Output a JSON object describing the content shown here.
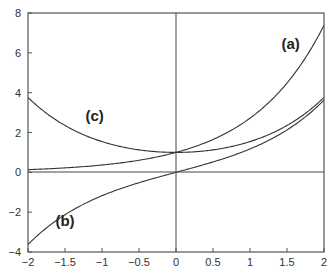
{
  "chart_data": {
    "type": "line",
    "title": "",
    "xlabel": "",
    "ylabel": "",
    "xlim": [
      -2,
      2
    ],
    "ylim": [
      -4,
      8
    ],
    "grid": false,
    "x_ticks": [
      -2,
      -1.5,
      -1,
      -0.5,
      0,
      0.5,
      1,
      1.5,
      2
    ],
    "x_tick_labels": [
      "−2",
      "−1.5",
      "−1",
      "−0.5",
      "0",
      "0.5",
      "1",
      "1.5",
      "2"
    ],
    "y_ticks": [
      -4,
      -2,
      0,
      2,
      4,
      6,
      8
    ],
    "y_tick_labels": [
      "−4",
      "−2",
      "0",
      "2",
      "4",
      "6",
      "8"
    ],
    "x": [
      -2,
      -1.5,
      -1,
      -0.5,
      0,
      0.5,
      1,
      1.5,
      2
    ],
    "series": [
      {
        "name": "(a)",
        "values": [
          0.14,
          0.22,
          0.37,
          0.61,
          1.0,
          1.65,
          2.72,
          4.48,
          7.39
        ]
      },
      {
        "name": "(b)",
        "values": [
          -3.63,
          -2.13,
          -1.18,
          -0.52,
          0.0,
          0.52,
          1.18,
          2.13,
          3.63
        ]
      },
      {
        "name": "(c)",
        "values": [
          3.76,
          2.35,
          1.54,
          1.13,
          1.0,
          1.13,
          1.54,
          2.35,
          3.76
        ]
      }
    ],
    "annotations": [
      {
        "text": "(a)",
        "x": 1.55,
        "y": 6.2
      },
      {
        "text": "(b)",
        "x": -1.5,
        "y": -2.7
      },
      {
        "text": "(c)",
        "x": -1.1,
        "y": 2.6
      }
    ],
    "reference_lines": {
      "x0_vertical": true,
      "y0_horizontal": true
    }
  }
}
